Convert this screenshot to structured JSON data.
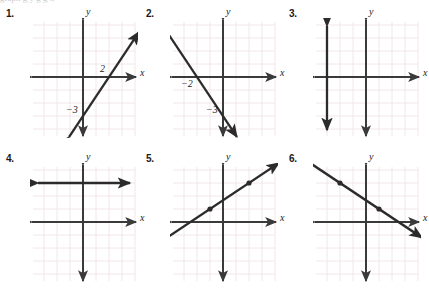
{
  "page": {
    "background": "#ffffff",
    "grid_color": "#f0e3e6",
    "axis_color": "#3a3a3a",
    "line_color": "#2b2b2b",
    "text_color": "#1a1a1a",
    "cut_off_top_text": "graph  g  y  g  g  x"
  },
  "axis_labels": {
    "x": "x",
    "y": "y"
  },
  "problems": [
    {
      "number": "1.",
      "name": "problem-1",
      "graph": {
        "type": "line",
        "description": "increasing line through x-intercept 2 and y-intercept -3",
        "points": [
          [
            2,
            0
          ],
          [
            0,
            -3
          ]
        ],
        "slope": 1.5,
        "x_intercept": 2,
        "y_intercept": -3,
        "annotations": [
          {
            "text": "2",
            "x": 2,
            "y": 0,
            "place": "above-left"
          },
          {
            "text": "−3",
            "x": 0,
            "y": -3,
            "place": "left"
          }
        ],
        "markers": []
      }
    },
    {
      "number": "2.",
      "name": "problem-2",
      "graph": {
        "type": "line",
        "description": "decreasing line through x-intercept -2 and y-intercept -3",
        "points": [
          [
            -2,
            0
          ],
          [
            0,
            -3
          ]
        ],
        "slope": -1.5,
        "x_intercept": -2,
        "y_intercept": -3,
        "annotations": [
          {
            "text": "−2",
            "x": -2,
            "y": 0,
            "place": "below-left"
          },
          {
            "text": "−3",
            "x": 0,
            "y": -3,
            "place": "left"
          }
        ],
        "markers": []
      }
    },
    {
      "number": "3.",
      "name": "problem-3",
      "graph": {
        "type": "vertical-line",
        "description": "vertical line at x = -3",
        "x_value": -3,
        "annotations": [],
        "markers": []
      }
    },
    {
      "number": "4.",
      "name": "problem-4",
      "graph": {
        "type": "horizontal-line",
        "description": "horizontal line at y = 3",
        "y_value": 3,
        "annotations": [],
        "markers": []
      }
    },
    {
      "number": "5.",
      "name": "problem-5",
      "graph": {
        "type": "line",
        "description": "increasing line through plotted points (-1,1) and (2,3)",
        "points": [
          [
            -1,
            1
          ],
          [
            2,
            3
          ]
        ],
        "slope": 0.667,
        "x_intercept": -2.5,
        "y_intercept": 1.67,
        "annotations": [],
        "markers": [
          [
            -1,
            1
          ],
          [
            2,
            3
          ]
        ]
      }
    },
    {
      "number": "6.",
      "name": "problem-6",
      "graph": {
        "type": "line",
        "description": "decreasing line through plotted points (-2,3) and (1,1)",
        "points": [
          [
            -2,
            3
          ],
          [
            1,
            1
          ]
        ],
        "slope": -0.667,
        "x_intercept": 2.5,
        "y_intercept": 1.67,
        "annotations": [],
        "markers": [
          [
            -2,
            3
          ],
          [
            1,
            1
          ]
        ]
      }
    }
  ]
}
